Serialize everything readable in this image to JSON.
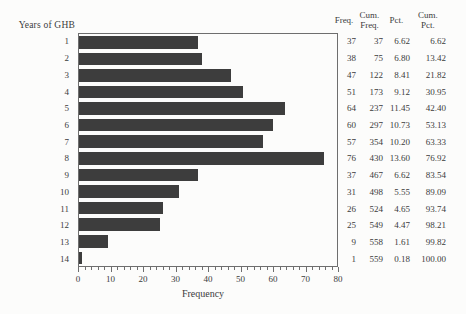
{
  "figure": {
    "y_axis_title": "Years of GHB",
    "x_axis_label": "Frequency"
  },
  "chart_data": {
    "type": "bar",
    "orientation": "horizontal",
    "title": "",
    "xlabel": "Frequency",
    "ylabel": "Years of GHB",
    "categories": [
      "1",
      "2",
      "3",
      "4",
      "5",
      "6",
      "7",
      "8",
      "9",
      "10",
      "11",
      "12",
      "13",
      "14"
    ],
    "values": [
      37,
      38,
      47,
      51,
      64,
      60,
      57,
      76,
      37,
      31,
      26,
      25,
      9,
      1
    ],
    "xlim": [
      0,
      80
    ],
    "x_major_ticks": [
      0,
      10,
      20,
      30,
      40,
      50,
      60,
      70,
      80
    ],
    "x_minor_tick_step": 2,
    "grid": false,
    "legend": false,
    "bar_color": "#3d3d3d"
  },
  "table": {
    "headers": [
      [
        "Freq."
      ],
      [
        "Cum.",
        "Freq."
      ],
      [
        "Pct."
      ],
      [
        "Cum.",
        "Pct."
      ]
    ],
    "rows": [
      [
        "37",
        "37",
        "6.62",
        "6.62"
      ],
      [
        "38",
        "75",
        "6.80",
        "13.42"
      ],
      [
        "47",
        "122",
        "8.41",
        "21.82"
      ],
      [
        "51",
        "173",
        "9.12",
        "30.95"
      ],
      [
        "64",
        "237",
        "11.45",
        "42.40"
      ],
      [
        "60",
        "297",
        "10.73",
        "53.13"
      ],
      [
        "57",
        "354",
        "10.20",
        "63.33"
      ],
      [
        "76",
        "430",
        "13.60",
        "76.92"
      ],
      [
        "37",
        "467",
        "6.62",
        "83.54"
      ],
      [
        "31",
        "498",
        "5.55",
        "89.09"
      ],
      [
        "26",
        "524",
        "4.65",
        "93.74"
      ],
      [
        "25",
        "549",
        "4.47",
        "98.21"
      ],
      [
        "9",
        "558",
        "1.61",
        "99.82"
      ],
      [
        "1",
        "559",
        "0.18",
        "100.00"
      ]
    ]
  },
  "colors": {
    "bar": "#3d3d3d",
    "text": "#3b3b3b",
    "axis": "#6e6e6e",
    "background": "#fcfcfb"
  }
}
